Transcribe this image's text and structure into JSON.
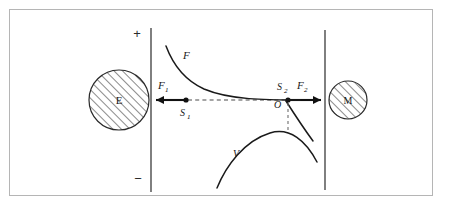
{
  "figure": {
    "kind": "physics-diagram",
    "title_visible": false,
    "background_color": "#ffffff",
    "frame_color": "#b5b5b5",
    "ink_color": "#1a1a1a"
  },
  "axis": {
    "polarity_top_label": "+",
    "polarity_bottom_label": "−",
    "left_plate_x": 151,
    "right_plate_x": 325,
    "baseline_y": 100
  },
  "bodies": [
    {
      "name": "electron-body",
      "label": "E",
      "cx": 119,
      "cy": 100,
      "r": 30,
      "hatch": "diagonal-45"
    },
    {
      "name": "mass-body",
      "label": "M",
      "cx": 348,
      "cy": 100,
      "r": 19,
      "hatch": "diagonal-45"
    }
  ],
  "points": [
    {
      "name": "point-s1",
      "label": "S",
      "subscript": "1",
      "x": 186,
      "y": 100
    },
    {
      "name": "point-s2",
      "label": "S",
      "subscript": "2",
      "x": 288,
      "y": 100
    },
    {
      "name": "point-origin",
      "label": "O",
      "subscript": "",
      "x": 288,
      "y": 100
    }
  ],
  "forces": [
    {
      "name": "force-f1",
      "label": "F",
      "subscript": "1",
      "direction": "left",
      "tail_x": 186,
      "head_x": 153,
      "y": 100
    },
    {
      "name": "force-f2",
      "label": "F",
      "subscript": "2",
      "direction": "right",
      "tail_x": 288,
      "head_x": 324,
      "y": 100
    }
  ],
  "curves": [
    {
      "name": "force-curve",
      "label": "F",
      "label_x": 183,
      "label_y": 57,
      "description": "decaying force curve asymptotic to the axis"
    },
    {
      "name": "potential-curve",
      "label": "V",
      "label_x": 236,
      "label_y": 155,
      "description": "inverted-U potential curve peaking under the origin"
    }
  ],
  "guides": [
    {
      "name": "axis-dashed-segment",
      "style": "dashed",
      "from_x": 186,
      "to_x": 288,
      "y": 100
    },
    {
      "name": "origin-drop-line",
      "style": "dashed",
      "x": 288,
      "from_y": 102,
      "to_y": 133
    }
  ]
}
